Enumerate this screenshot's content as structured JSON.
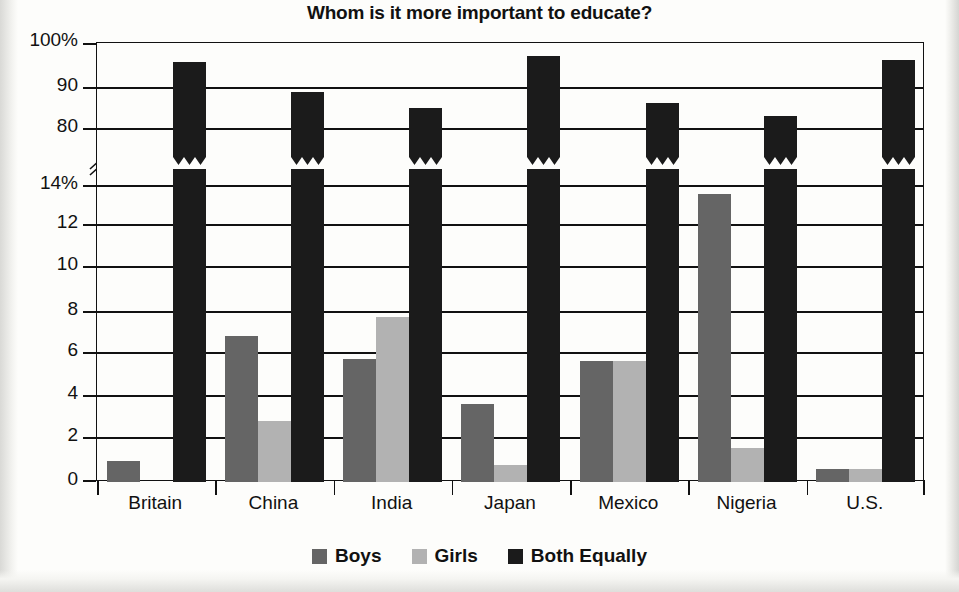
{
  "chart_data": {
    "type": "bar",
    "title": "Whom is it more important to educate?",
    "xlabel": "",
    "ylabel": "",
    "categories": [
      "Britain",
      "China",
      "India",
      "Japan",
      "Mexico",
      "Nigeria",
      "U.S."
    ],
    "series": [
      {
        "name": "Boys",
        "color": "#656565",
        "values": [
          1.0,
          6.9,
          5.8,
          3.7,
          5.7,
          13.6,
          0.6
        ]
      },
      {
        "name": "Girls",
        "color": "#b2b2b2",
        "values": [
          0.0,
          2.9,
          7.8,
          0.8,
          5.7,
          1.6,
          0.6
        ]
      },
      {
        "name": "Both Equally",
        "color": "#1b1b1b",
        "values": [
          95.5,
          88.5,
          85.0,
          97.0,
          86.0,
          83.0,
          96.0
        ]
      }
    ],
    "axis_break": true,
    "y_upper_ticks": [
      "100%",
      "90",
      "80"
    ],
    "y_lower_ticks": [
      "14%",
      "12",
      "10",
      "8",
      "6",
      "4",
      "2",
      "0"
    ],
    "ylim_lower": [
      0,
      14
    ],
    "ylim_upper": [
      78,
      100
    ],
    "grid": true,
    "legend_position": "bottom"
  },
  "legend": {
    "items": [
      {
        "label": "Boys",
        "color": "#656565",
        "swatch_name": "legend-swatch-boys"
      },
      {
        "label": "Girls",
        "color": "#b2b2b2",
        "swatch_name": "legend-swatch-girls"
      },
      {
        "label": "Both Equally",
        "color": "#1b1b1b",
        "swatch_name": "legend-swatch-both-equally"
      }
    ]
  }
}
